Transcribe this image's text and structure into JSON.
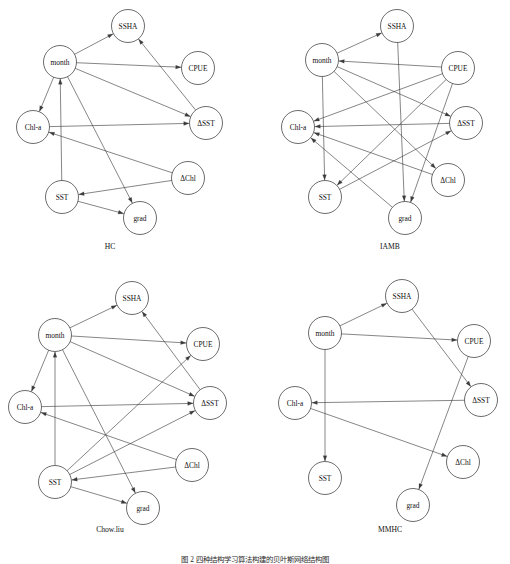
{
  "figure": {
    "caption": "图 2  四种结构学习算法构建的贝叶斯网络结构图",
    "caption_y": 553
  },
  "nodes_meta": {
    "radius": 16.5,
    "node_ids": [
      "month",
      "SSHA",
      "CPUE",
      "dSST",
      "Chl_a",
      "SST",
      "grad",
      "dChl"
    ],
    "labels": {
      "month": "month",
      "SSHA": "SSHA",
      "CPUE": "CPUE",
      "dSST": "ΔSST",
      "Chl_a": "Chl-a",
      "SST": "SST",
      "grad": "grad",
      "dChl": "ΔChl"
    }
  },
  "colors": {
    "node_stroke": "#3b3b3b",
    "node_fill": "#ffffff",
    "edge_stroke": "#3b3b3b",
    "text": "#111111",
    "background": "#ffffff"
  },
  "chart_data": {
    "type": "diagram",
    "subtype": "directed-acyclic-graph-grid",
    "title": "图 2  四种结构学习算法构建的贝叶斯网络结构图",
    "grid": {
      "rows": 2,
      "cols": 2
    },
    "variables": [
      "month",
      "SSHA",
      "CPUE",
      "ΔSST",
      "Chl-a",
      "SST",
      "grad",
      "ΔChl"
    ],
    "panels": [
      {
        "id": "hc",
        "label": "HC",
        "label_x": 110,
        "label_y": 248,
        "nodes": [
          {
            "id": "month",
            "label": "month",
            "x": 60,
            "y": 62
          },
          {
            "id": "SSHA",
            "label": "SSHA",
            "x": 128,
            "y": 26
          },
          {
            "id": "CPUE",
            "label": "CPUE",
            "x": 198,
            "y": 68
          },
          {
            "id": "dSST",
            "label": "ΔSST",
            "x": 206,
            "y": 123
          },
          {
            "id": "Chl_a",
            "label": "Chl-a",
            "x": 33,
            "y": 127
          },
          {
            "id": "SST",
            "label": "SST",
            "x": 62,
            "y": 197
          },
          {
            "id": "grad",
            "label": "grad",
            "x": 140,
            "y": 218
          },
          {
            "id": "dChl",
            "label": "ΔChl",
            "x": 188,
            "y": 178
          }
        ],
        "edges": [
          {
            "from": "month",
            "to": "SSHA"
          },
          {
            "from": "month",
            "to": "CPUE"
          },
          {
            "from": "month",
            "to": "dSST"
          },
          {
            "from": "month",
            "to": "Chl_a"
          },
          {
            "from": "month",
            "to": "grad"
          },
          {
            "from": "SST",
            "to": "month"
          },
          {
            "from": "Chl_a",
            "to": "dSST"
          },
          {
            "from": "dSST",
            "to": "SSHA"
          },
          {
            "from": "dChl",
            "to": "Chl_a"
          },
          {
            "from": "dChl",
            "to": "SST"
          },
          {
            "from": "SST",
            "to": "grad"
          }
        ]
      },
      {
        "id": "iamb",
        "label": "IAMB",
        "label_x": 390,
        "label_y": 248,
        "nodes": [
          {
            "id": "month",
            "label": "month",
            "x": 322,
            "y": 60
          },
          {
            "id": "SSHA",
            "label": "SSHA",
            "x": 397,
            "y": 26
          },
          {
            "id": "CPUE",
            "label": "CPUE",
            "x": 458,
            "y": 68
          },
          {
            "id": "dSST",
            "label": "ΔSST",
            "x": 466,
            "y": 123
          },
          {
            "id": "Chl_a",
            "label": "Chl-a",
            "x": 298,
            "y": 127
          },
          {
            "id": "SST",
            "label": "SST",
            "x": 325,
            "y": 197
          },
          {
            "id": "grad",
            "label": "grad",
            "x": 405,
            "y": 218
          },
          {
            "id": "dChl",
            "label": "ΔChl",
            "x": 448,
            "y": 180
          }
        ],
        "edges": [
          {
            "from": "month",
            "to": "SSHA"
          },
          {
            "from": "CPUE",
            "to": "month"
          },
          {
            "from": "month",
            "to": "SST"
          },
          {
            "from": "month",
            "to": "dChl"
          },
          {
            "from": "month",
            "to": "dSST"
          },
          {
            "from": "CPUE",
            "to": "Chl_a"
          },
          {
            "from": "CPUE",
            "to": "SST"
          },
          {
            "from": "CPUE",
            "to": "grad"
          },
          {
            "from": "dSST",
            "to": "Chl_a"
          },
          {
            "from": "SSHA",
            "to": "grad"
          },
          {
            "from": "dChl",
            "to": "Chl_a"
          },
          {
            "from": "grad",
            "to": "Chl_a"
          },
          {
            "from": "SST",
            "to": "dSST"
          }
        ]
      },
      {
        "id": "chowliu",
        "label": "Chow.liu",
        "label_x": 110,
        "label_y": 531,
        "nodes": [
          {
            "id": "month",
            "label": "month",
            "x": 55,
            "y": 335
          },
          {
            "id": "SSHA",
            "label": "SSHA",
            "x": 132,
            "y": 298
          },
          {
            "id": "CPUE",
            "label": "CPUE",
            "x": 203,
            "y": 344
          },
          {
            "id": "dSST",
            "label": "ΔSST",
            "x": 210,
            "y": 403
          },
          {
            "id": "Chl_a",
            "label": "Chl-a",
            "x": 25,
            "y": 407
          },
          {
            "id": "SST",
            "label": "SST",
            "x": 55,
            "y": 482
          },
          {
            "id": "grad",
            "label": "grad",
            "x": 143,
            "y": 508
          },
          {
            "id": "dChl",
            "label": "ΔChl",
            "x": 192,
            "y": 465
          }
        ],
        "edges": [
          {
            "from": "month",
            "to": "SSHA"
          },
          {
            "from": "month",
            "to": "CPUE"
          },
          {
            "from": "month",
            "to": "dSST"
          },
          {
            "from": "month",
            "to": "Chl_a"
          },
          {
            "from": "month",
            "to": "grad"
          },
          {
            "from": "SST",
            "to": "month"
          },
          {
            "from": "Chl_a",
            "to": "dSST"
          },
          {
            "from": "dSST",
            "to": "SSHA"
          },
          {
            "from": "SST",
            "to": "CPUE"
          },
          {
            "from": "SST",
            "to": "dSST"
          },
          {
            "from": "dChl",
            "to": "Chl_a"
          },
          {
            "from": "dChl",
            "to": "SST"
          },
          {
            "from": "SST",
            "to": "grad"
          }
        ]
      },
      {
        "id": "mmhc",
        "label": "MMHC",
        "label_x": 390,
        "label_y": 531,
        "nodes": [
          {
            "id": "month",
            "label": "month",
            "x": 325,
            "y": 333
          },
          {
            "id": "SSHA",
            "label": "SSHA",
            "x": 402,
            "y": 296
          },
          {
            "id": "CPUE",
            "label": "CPUE",
            "x": 474,
            "y": 341
          },
          {
            "id": "dSST",
            "label": "ΔSST",
            "x": 481,
            "y": 400
          },
          {
            "id": "Chl_a",
            "label": "Chl-a",
            "x": 295,
            "y": 403
          },
          {
            "id": "SST",
            "label": "SST",
            "x": 325,
            "y": 478
          },
          {
            "id": "grad",
            "label": "grad",
            "x": 413,
            "y": 505
          },
          {
            "id": "dChl",
            "label": "ΔChl",
            "x": 463,
            "y": 462
          }
        ],
        "edges": [
          {
            "from": "month",
            "to": "SSHA"
          },
          {
            "from": "month",
            "to": "CPUE"
          },
          {
            "from": "month",
            "to": "SST"
          },
          {
            "from": "SSHA",
            "to": "dSST"
          },
          {
            "from": "CPUE",
            "to": "grad"
          },
          {
            "from": "dSST",
            "to": "Chl_a"
          },
          {
            "from": "Chl_a",
            "to": "dChl"
          }
        ]
      }
    ]
  }
}
